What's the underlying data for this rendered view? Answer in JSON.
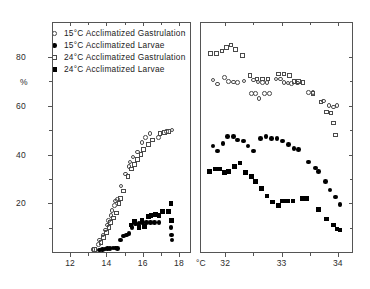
{
  "chart_data": {
    "type": "scatter",
    "title": "",
    "ylabel": "%",
    "xlabel": "°C",
    "ylim": [
      0,
      88
    ],
    "yticks": [
      20,
      40,
      60,
      80
    ],
    "ytick_labels": [
      "20",
      "40",
      "60",
      "80"
    ],
    "yminor": [
      10,
      30,
      50,
      70
    ],
    "grid": false,
    "legend_position": "top-left",
    "panels": [
      {
        "name": "left-panel",
        "xlim": [
          11.0,
          18.6
        ],
        "xticks": [
          12,
          14,
          16,
          18
        ],
        "xtick_labels": [
          "12",
          "14",
          "16",
          "18"
        ],
        "xminor": [
          13,
          15,
          17
        ],
        "series": [
          {
            "name": "15°C Acclimatized Gastrulation",
            "marker": "open-circle",
            "points": [
              [
                13.25,
                1.0
              ],
              [
                13.55,
                3.0
              ],
              [
                13.62,
                5.0
              ],
              [
                13.8,
                7.0
              ],
              [
                13.95,
                9.0
              ],
              [
                14.05,
                11.0
              ],
              [
                14.1,
                13.0
              ],
              [
                14.25,
                15.0
              ],
              [
                14.3,
                17.0
              ],
              [
                14.45,
                19.0
              ],
              [
                14.5,
                21.0
              ],
              [
                14.62,
                21.5
              ],
              [
                14.8,
                27.0
              ],
              [
                15.05,
                32.0
              ],
              [
                15.25,
                35.0
              ],
              [
                15.3,
                37.0
              ],
              [
                15.45,
                39.0
              ],
              [
                15.7,
                41.0
              ],
              [
                15.95,
                45.0
              ],
              [
                16.15,
                47.0
              ],
              [
                16.4,
                48.5
              ],
              [
                16.85,
                47.0
              ],
              [
                17.3,
                49.5
              ],
              [
                17.6,
                50.0
              ]
            ]
          },
          {
            "name": "15°C Acclimatized Larvae",
            "marker": "filled-circle",
            "points": [
              [
                13.6,
                0.8
              ],
              [
                13.78,
                1.0
              ],
              [
                13.92,
                1.2
              ],
              [
                14.05,
                1.4
              ],
              [
                14.2,
                1.5
              ],
              [
                14.35,
                1.6
              ],
              [
                14.5,
                1.7
              ],
              [
                14.62,
                1.5
              ],
              [
                14.78,
                5.0
              ],
              [
                14.95,
                6.5
              ],
              [
                15.1,
                7.0
              ],
              [
                15.25,
                7.5
              ],
              [
                15.4,
                10.0
              ],
              [
                15.6,
                11.5
              ],
              [
                15.8,
                11.8
              ],
              [
                16.0,
                12.0
              ],
              [
                16.2,
                12.0
              ],
              [
                16.42,
                12.0
              ],
              [
                16.65,
                12.0
              ],
              [
                16.9,
                12.0
              ],
              [
                17.55,
                10.0
              ],
              [
                17.58,
                7.0
              ],
              [
                17.6,
                5.0
              ]
            ]
          },
          {
            "name": "24°C Acclimatized Gastrulation",
            "marker": "open-square",
            "points": [
              [
                13.35,
                1.0
              ],
              [
                13.7,
                4.0
              ],
              [
                13.85,
                6.0
              ],
              [
                14.0,
                8.0
              ],
              [
                14.15,
                10.0
              ],
              [
                14.22,
                12.0
              ],
              [
                14.38,
                14.0
              ],
              [
                14.55,
                16.0
              ],
              [
                14.7,
                20.0
              ],
              [
                14.78,
                22.0
              ],
              [
                14.95,
                25.0
              ],
              [
                15.18,
                31.0
              ],
              [
                15.38,
                34.0
              ],
              [
                15.55,
                36.0
              ],
              [
                15.72,
                38.0
              ],
              [
                15.9,
                40.0
              ],
              [
                16.05,
                42.0
              ],
              [
                16.3,
                44.0
              ],
              [
                16.55,
                46.0
              ],
              [
                16.95,
                48.5
              ],
              [
                17.2,
                49.0
              ],
              [
                17.4,
                49.5
              ]
            ]
          },
          {
            "name": "24°C Acclimatized Larvae",
            "marker": "filled-square",
            "points": [
              [
                15.35,
                11.0
              ],
              [
                15.55,
                12.5
              ],
              [
                15.8,
                10.0
              ],
              [
                15.95,
                13.0
              ],
              [
                16.1,
                10.5
              ],
              [
                16.3,
                14.5
              ],
              [
                16.45,
                15.0
              ],
              [
                16.7,
                15.5
              ],
              [
                16.9,
                15.0
              ],
              [
                17.1,
                16.5
              ],
              [
                17.4,
                16.5
              ],
              [
                17.55,
                20.0
              ],
              [
                17.58,
                13.0
              ]
            ]
          }
        ]
      },
      {
        "name": "right-panel",
        "xlim": [
          31.55,
          34.25
        ],
        "xticks": [
          32,
          33,
          34
        ],
        "xtick_labels": [
          "32",
          "33",
          "34"
        ],
        "xminor": [
          32.5,
          33.5
        ],
        "series": [
          {
            "name": "15°C Acclimatized Gastrulation",
            "marker": "open-circle",
            "points": [
              [
                31.78,
                70.5
              ],
              [
                31.86,
                69.0
              ],
              [
                31.98,
                71.5
              ],
              [
                32.06,
                70.0
              ],
              [
                32.14,
                69.8
              ],
              [
                32.22,
                69.6
              ],
              [
                32.33,
                70.2
              ],
              [
                32.5,
                70.5
              ],
              [
                32.58,
                69.8
              ],
              [
                32.66,
                69.6
              ],
              [
                32.74,
                69.5
              ],
              [
                32.9,
                71.0
              ],
              [
                32.98,
                71.0
              ],
              [
                33.04,
                69.5
              ],
              [
                33.11,
                69.3
              ],
              [
                33.18,
                69.2
              ],
              [
                33.28,
                69.3
              ],
              [
                32.46,
                65.0
              ],
              [
                32.54,
                65.0
              ],
              [
                32.7,
                65.0
              ],
              [
                32.78,
                65.0
              ],
              [
                32.6,
                63.0
              ],
              [
                33.48,
                65.5
              ],
              [
                33.56,
                65.5
              ],
              [
                33.84,
                60.0
              ],
              [
                33.92,
                59.5
              ],
              [
                33.98,
                60.0
              ],
              [
                33.74,
                62.0
              ]
            ]
          },
          {
            "name": "15°C Acclimatized Larvae",
            "marker": "filled-circle",
            "points": [
              [
                31.78,
                43.5
              ],
              [
                31.86,
                41.5
              ],
              [
                31.96,
                44.5
              ],
              [
                32.04,
                47.5
              ],
              [
                32.14,
                47.5
              ],
              [
                32.22,
                46.0
              ],
              [
                32.32,
                45.5
              ],
              [
                32.4,
                43.5
              ],
              [
                32.5,
                41.5
              ],
              [
                32.62,
                46.5
              ],
              [
                32.72,
                47.5
              ],
              [
                32.82,
                46.5
              ],
              [
                32.92,
                46.5
              ],
              [
                33.02,
                45.5
              ],
              [
                33.12,
                44.0
              ],
              [
                33.22,
                42.5
              ],
              [
                33.3,
                42.0
              ],
              [
                33.48,
                37.0
              ],
              [
                33.66,
                33.0
              ],
              [
                33.78,
                29.0
              ],
              [
                33.86,
                25.5
              ],
              [
                33.96,
                22.5
              ],
              [
                34.04,
                19.5
              ],
              [
                33.6,
                34.5
              ]
            ]
          },
          {
            "name": "24°C Acclimatized Gastrulation",
            "marker": "open-square",
            "points": [
              [
                31.74,
                81.5
              ],
              [
                31.84,
                81.5
              ],
              [
                31.94,
                82.5
              ],
              [
                32.02,
                84.0
              ],
              [
                32.1,
                85.0
              ],
              [
                32.18,
                83.0
              ],
              [
                32.3,
                80.5
              ],
              [
                32.44,
                72.5
              ],
              [
                32.56,
                71.0
              ],
              [
                32.66,
                71.0
              ],
              [
                32.76,
                71.0
              ],
              [
                32.94,
                73.0
              ],
              [
                33.04,
                73.0
              ],
              [
                33.14,
                72.5
              ],
              [
                33.22,
                70.0
              ],
              [
                33.3,
                70.0
              ],
              [
                33.38,
                69.5
              ],
              [
                33.56,
                65.0
              ],
              [
                33.7,
                61.5
              ],
              [
                33.8,
                57.5
              ],
              [
                33.88,
                57.0
              ],
              [
                33.92,
                53.0
              ],
              [
                33.96,
                48.0
              ]
            ]
          },
          {
            "name": "24°C Acclimatized Larvae",
            "marker": "filled-square",
            "points": [
              [
                31.72,
                33.0
              ],
              [
                31.82,
                34.0
              ],
              [
                31.9,
                34.0
              ],
              [
                31.98,
                32.5
              ],
              [
                32.06,
                33.0
              ],
              [
                32.16,
                35.0
              ],
              [
                32.26,
                36.5
              ],
              [
                32.36,
                32.5
              ],
              [
                32.46,
                31.0
              ],
              [
                32.54,
                29.0
              ],
              [
                32.64,
                26.0
              ],
              [
                32.74,
                23.0
              ],
              [
                32.84,
                20.5
              ],
              [
                32.94,
                19.0
              ],
              [
                33.02,
                21.0
              ],
              [
                33.1,
                21.0
              ],
              [
                33.2,
                21.0
              ],
              [
                33.36,
                22.0
              ],
              [
                33.44,
                22.0
              ],
              [
                33.66,
                17.5
              ],
              [
                33.8,
                13.5
              ],
              [
                33.92,
                11.0
              ],
              [
                33.98,
                9.5
              ],
              [
                34.04,
                9.0
              ]
            ]
          }
        ]
      }
    ],
    "legend": [
      {
        "marker": "open-circle",
        "label": "15°C  Acclimatized  Gastrulation"
      },
      {
        "marker": "filled-circle",
        "label": "15°C  Acclimatized  Larvae"
      },
      {
        "marker": "open-square",
        "label": "24°C  Acclimatized  Gastrulation"
      },
      {
        "marker": "filled-square",
        "label": "24°C  Acclimatized  Larvae"
      }
    ]
  }
}
